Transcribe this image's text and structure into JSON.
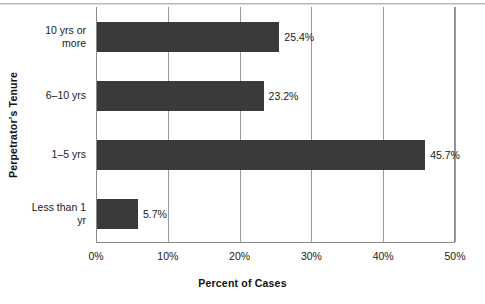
{
  "chart_data": {
    "type": "bar",
    "orientation": "horizontal",
    "title": "",
    "xlabel": "Percent of Cases",
    "ylabel": "Perpetrator's Tenure",
    "categories": [
      "Less than 1 yr",
      "1–5 yrs",
      "6–10 yrs",
      "10 yrs or more"
    ],
    "category_label_lines": [
      [
        "Less than 1",
        "yr"
      ],
      [
        "1–5 yrs"
      ],
      [
        "6–10 yrs"
      ],
      [
        "10 yrs or",
        "more"
      ]
    ],
    "values": [
      5.7,
      45.7,
      23.2,
      25.4
    ],
    "value_labels": [
      "5.7%",
      "45.7%",
      "23.2%",
      "25.4%"
    ],
    "xlim": [
      0,
      50
    ],
    "xticks": [
      0,
      10,
      20,
      30,
      40,
      50
    ],
    "xtick_labels": [
      "0%",
      "10%",
      "20%",
      "30%",
      "40%",
      "50%"
    ],
    "grid": "vertical",
    "legend": "none",
    "bar_color": "#3a3a3a",
    "axis_color": "#8a8a8a",
    "gridline_color": "#9a9a9a",
    "background_color": "#ffffff"
  }
}
